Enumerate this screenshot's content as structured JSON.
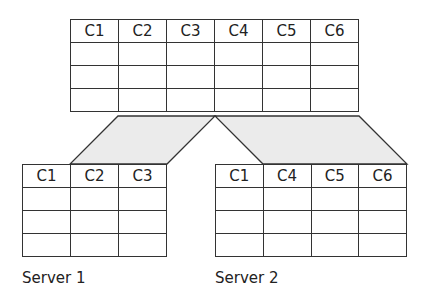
{
  "diagram": {
    "type": "vertical-partitioning",
    "colors": {
      "line": "#333333",
      "fill": "#ebebeb",
      "background": "#ffffff"
    },
    "top_table": {
      "columns": [
        "C1",
        "C2",
        "C3",
        "C4",
        "C5",
        "C6"
      ],
      "rows": [
        [
          "",
          "",
          "",
          "",
          "",
          ""
        ],
        [
          "",
          "",
          "",
          "",
          "",
          ""
        ],
        [
          "",
          "",
          "",
          "",
          "",
          ""
        ]
      ]
    },
    "partitions": [
      {
        "label": "Server 1",
        "columns": [
          "C1",
          "C2",
          "C3"
        ],
        "rows": [
          [
            "",
            "",
            ""
          ],
          [
            "",
            "",
            ""
          ],
          [
            "",
            "",
            ""
          ]
        ]
      },
      {
        "label": "Server 2",
        "columns": [
          "C1",
          "C4",
          "C5",
          "C6"
        ],
        "rows": [
          [
            "",
            "",
            "",
            ""
          ],
          [
            "",
            "",
            "",
            ""
          ],
          [
            "",
            "",
            "",
            ""
          ]
        ]
      }
    ]
  }
}
